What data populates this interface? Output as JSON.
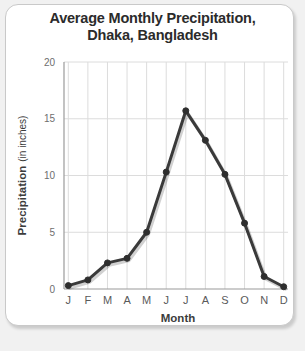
{
  "panel": {
    "background_color": "#ffffff",
    "border_color": "#c9c9c9"
  },
  "chart_data": {
    "type": "line",
    "title": "Average Monthly Precipitation,\nDhaka, Bangladesh",
    "title_line1": "Average Monthly Precipitation,",
    "title_line2": "Dhaka, Bangladesh",
    "xlabel": "Month",
    "ylabel": "Precipitation",
    "ylabel_unit": "(in inches)",
    "categories": [
      "J",
      "F",
      "M",
      "A",
      "M",
      "J",
      "J",
      "A",
      "S",
      "O",
      "N",
      "D"
    ],
    "values": [
      0.3,
      0.8,
      2.3,
      2.7,
      5.0,
      10.3,
      15.7,
      13.1,
      10.1,
      5.8,
      1.1,
      0.2
    ],
    "ylim": [
      0,
      20
    ],
    "yticks": [
      0,
      5,
      10,
      15,
      20
    ],
    "ytick_labels": [
      "0",
      "5",
      "10",
      "15",
      "20"
    ],
    "grid": true,
    "legend": "none",
    "line_color": "#3a3a3a",
    "marker_color": "#2e2e2e",
    "grid_color": "#dcdcdc",
    "axis_color": "#9a9a9a"
  }
}
